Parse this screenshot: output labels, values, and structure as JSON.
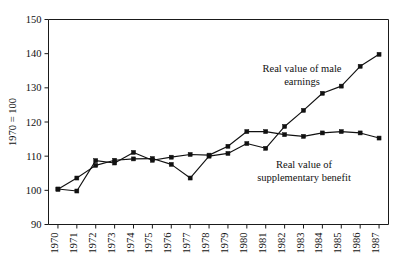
{
  "chart_data": {
    "type": "line",
    "title": "",
    "xlabel": "",
    "ylabel": "1970 = 100",
    "ylim": [
      90,
      150
    ],
    "yticks": [
      90,
      100,
      110,
      120,
      130,
      140,
      150
    ],
    "grid": false,
    "legend_position": "inline-annotations",
    "categories": [
      "1970",
      "1971",
      "1972",
      "1973",
      "1974",
      "1975",
      "1976",
      "1977",
      "1978",
      "1979",
      "1980",
      "1981",
      "1982",
      "1983",
      "1984",
      "1985",
      "1986",
      "1987"
    ],
    "series": [
      {
        "name": "Real value of male earnings",
        "values": [
          100.3,
          103.6,
          107.3,
          108.8,
          109.2,
          109.3,
          107.6,
          103.6,
          110.0,
          110.8,
          113.7,
          112.3,
          118.7,
          123.4,
          128.4,
          130.5,
          136.3,
          139.8
        ]
      },
      {
        "name": "Real value of supplementary benefit",
        "values": [
          100.4,
          99.8,
          108.7,
          108.0,
          111.1,
          108.8,
          109.7,
          110.5,
          110.3,
          112.9,
          117.2,
          117.2,
          116.3,
          115.8,
          116.8,
          117.2,
          116.8,
          115.3
        ]
      }
    ],
    "annotations": [
      {
        "id": "male-earnings",
        "line1": "Real value of male",
        "line2": "earnings"
      },
      {
        "id": "supplementary-benefit",
        "line1": "Real value of",
        "line2": "supplementary benefit"
      }
    ]
  },
  "axis": {
    "y_title": "1970 = 100",
    "y_tick_labels": [
      "150",
      "140",
      "130",
      "120",
      "110",
      "100",
      "90"
    ],
    "x_tick_labels": [
      "1970",
      "1971",
      "1972",
      "1973",
      "1974",
      "1975",
      "1976",
      "1977",
      "1978",
      "1979",
      "1980",
      "1981",
      "1982",
      "1983",
      "1984",
      "1985",
      "1986",
      "1987"
    ]
  },
  "colors": {
    "ink": "#111111",
    "background": "#ffffff"
  }
}
